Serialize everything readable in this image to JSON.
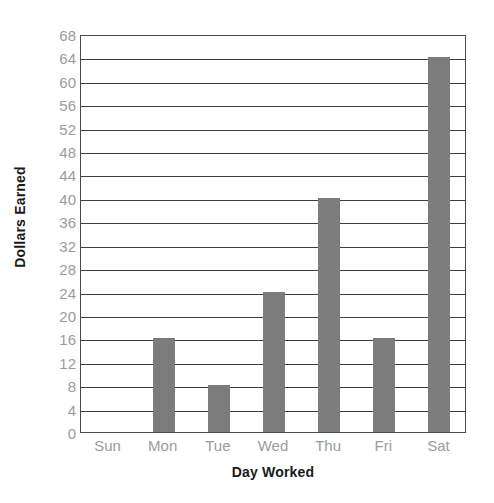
{
  "chart_data": {
    "type": "bar",
    "title": "",
    "subtitle": "",
    "xlabel": "Day Worked",
    "ylabel": "Dollars Earned",
    "categories": [
      "Sun",
      "Mon",
      "Tue",
      "Wed",
      "Thu",
      "Fri",
      "Sat"
    ],
    "values": [
      0,
      16,
      8,
      24,
      40,
      16,
      64
    ],
    "series": [
      {
        "name": "Dollars Earned",
        "values": [
          0,
          16,
          8,
          24,
          40,
          16,
          64
        ]
      }
    ],
    "ylim": [
      0,
      68
    ],
    "ytick_step": 4,
    "yticks": [
      0,
      4,
      8,
      12,
      16,
      20,
      24,
      28,
      32,
      36,
      40,
      44,
      48,
      52,
      56,
      60,
      64,
      68
    ],
    "ytick_labels": [
      "0",
      "4",
      "8",
      "12",
      "16",
      "20",
      "24",
      "28",
      "32",
      "36",
      "40",
      "44",
      "48",
      "52",
      "56",
      "60",
      "64",
      "68"
    ],
    "grid": true,
    "grid_axis": "y",
    "legend": false,
    "legend_position": "none",
    "annotations": []
  },
  "style": {
    "bar_color": "#7c7c7c",
    "gridline_color": "#3d3d3d",
    "frame_color": "#4a4a4a",
    "tick_label_color": "#9b9b9b",
    "axis_title_color": "#1a1a1a",
    "background_color": "#ffffff"
  }
}
